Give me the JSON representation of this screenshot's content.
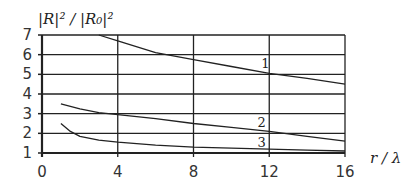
{
  "chart_data": {
    "type": "line",
    "title": "",
    "xlabel": "r / λ",
    "ylabel": "|R|² / |R₀|²",
    "xlim": [
      0,
      16
    ],
    "ylim": [
      1,
      7
    ],
    "x_ticks": [
      "0",
      "4",
      "8",
      "12",
      "16"
    ],
    "y_ticks": [
      "1",
      "2",
      "3",
      "4",
      "5",
      "6",
      "7"
    ],
    "grid": true,
    "legend": "none (curves labeled inline)",
    "series": [
      {
        "name": "1",
        "x": [
          3,
          4,
          6,
          8,
          10,
          12,
          14,
          16
        ],
        "values": [
          7.0,
          6.7,
          6.1,
          5.75,
          5.4,
          5.05,
          4.8,
          4.5
        ]
      },
      {
        "name": "2",
        "x": [
          1,
          2,
          3,
          4,
          6,
          8,
          10,
          12,
          14,
          16
        ],
        "values": [
          3.5,
          3.25,
          3.05,
          2.95,
          2.75,
          2.5,
          2.3,
          2.1,
          1.85,
          1.6
        ]
      },
      {
        "name": "3",
        "x": [
          1,
          1.5,
          2,
          3,
          4,
          6,
          8,
          10,
          12,
          14,
          16
        ],
        "values": [
          2.5,
          2.1,
          1.85,
          1.65,
          1.55,
          1.4,
          1.3,
          1.25,
          1.2,
          1.15,
          1.1
        ]
      }
    ],
    "annotations": [
      {
        "text": "1",
        "x": 11.8,
        "y": 5.3
      },
      {
        "text": "2",
        "x": 11.6,
        "y": 2.3
      },
      {
        "text": "3",
        "x": 11.6,
        "y": 1.3
      }
    ]
  }
}
